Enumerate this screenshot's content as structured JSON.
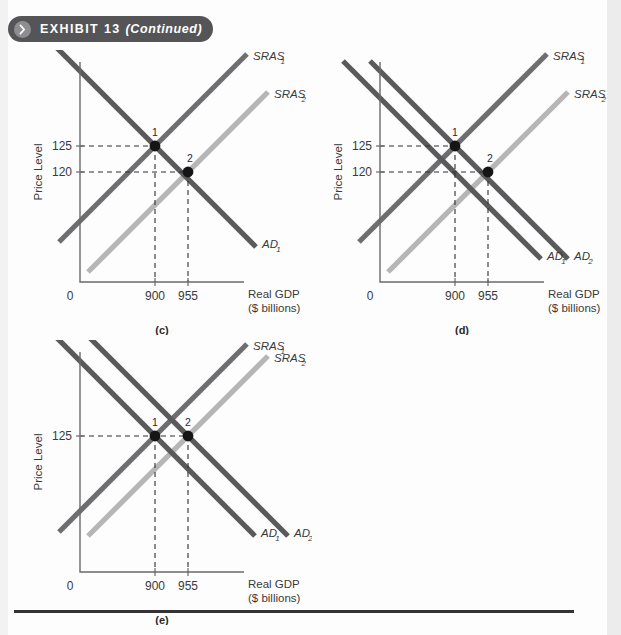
{
  "header": {
    "exhibit_label": "EXHIBIT 13",
    "continued_label": "(Continued)",
    "chevron_icon": "chevron-right-icon",
    "bar_color": "#555558",
    "chevron_color": "#8e8e92"
  },
  "colors": {
    "ad_curve": "#5a5a5c",
    "sras1_curve": "#6e6e70",
    "sras2_curve": "#b6b6b6",
    "axis": "#6a6a6a",
    "dashed": "#2f2f2f",
    "point": "#151515",
    "page_background": "#fdfdfd"
  },
  "common": {
    "ylabel": "Price Level",
    "xlabel_line1": "Real GDP",
    "xlabel_line2": "($ billions)",
    "origin_label": "0"
  },
  "chart_data": [
    {
      "type": "line",
      "panel": "(c)",
      "title": "",
      "xlabel": "Real GDP ($ billions)",
      "ylabel": "Price Level",
      "xticks": [
        "900",
        "955"
      ],
      "xtick_values": [
        900,
        955
      ],
      "yticks": [
        "125",
        "120"
      ],
      "ytick_values": [
        125,
        120
      ],
      "origin_label": "0",
      "grid": false,
      "series": [
        {
          "name": "AD",
          "label": "AD",
          "subscript": "1",
          "slope": "downward",
          "color": "#5a5a5c"
        },
        {
          "name": "SRAS1",
          "label": "SRAS",
          "subscript": "1",
          "slope": "upward",
          "color": "#6e6e70"
        },
        {
          "name": "SRAS2",
          "label": "SRAS",
          "subscript": "2",
          "slope": "upward",
          "color": "#b6b6b6"
        }
      ],
      "points": [
        {
          "label": "1",
          "x": 900,
          "y": 125,
          "on": "AD1 x SRAS1"
        },
        {
          "label": "2",
          "x": 955,
          "y": 120,
          "on": "AD1 x SRAS2"
        }
      ],
      "note": "SRAS shifts right; price level falls from 125 to 120, Real GDP rises from 900 to 955"
    },
    {
      "type": "line",
      "panel": "(d)",
      "title": "",
      "xlabel": "Real GDP ($ billions)",
      "ylabel": "Price Level",
      "xticks": [
        "900",
        "955"
      ],
      "xtick_values": [
        900,
        955
      ],
      "yticks": [
        "125",
        "120"
      ],
      "ytick_values": [
        125,
        120
      ],
      "origin_label": "0",
      "grid": false,
      "series": [
        {
          "name": "AD2",
          "label": "AD",
          "subscript": "2",
          "slope": "downward",
          "color": "#5a5a5c"
        },
        {
          "name": "AD1",
          "label": "AD",
          "subscript": "1",
          "slope": "downward",
          "color": "#5a5a5c"
        },
        {
          "name": "SRAS1",
          "label": "SRAS",
          "subscript": "1",
          "slope": "upward",
          "color": "#6e6e70"
        },
        {
          "name": "SRAS2",
          "label": "SRAS",
          "subscript": "2",
          "slope": "upward",
          "color": "#b6b6b6"
        }
      ],
      "points": [
        {
          "label": "1",
          "x": 900,
          "y": 125,
          "on": "AD2 x SRAS1"
        },
        {
          "label": "2",
          "x": 955,
          "y": 120,
          "on": "AD1 x SRAS2"
        }
      ],
      "note": "Both AD and SRAS shift; price level falls from 125 to 120, Real GDP rises from 900 to 955"
    },
    {
      "type": "line",
      "panel": "(e)",
      "title": "",
      "xlabel": "Real GDP ($ billions)",
      "ylabel": "Price Level",
      "xticks": [
        "900",
        "955"
      ],
      "xtick_values": [
        900,
        955
      ],
      "yticks": [
        "125"
      ],
      "ytick_values": [
        125
      ],
      "origin_label": "0",
      "grid": false,
      "series": [
        {
          "name": "AD2",
          "label": "AD",
          "subscript": "2",
          "slope": "downward",
          "color": "#5a5a5c"
        },
        {
          "name": "AD1",
          "label": "AD",
          "subscript": "1",
          "slope": "downward",
          "color": "#5a5a5c"
        },
        {
          "name": "SRAS1",
          "label": "SRAS",
          "subscript": "1",
          "slope": "upward",
          "color": "#6e6e70"
        },
        {
          "name": "SRAS2",
          "label": "SRAS",
          "subscript": "2",
          "slope": "upward",
          "color": "#b6b6b6"
        }
      ],
      "points": [
        {
          "label": "1",
          "x": 900,
          "y": 125,
          "on": "AD1 x SRAS1"
        },
        {
          "label": "2",
          "x": 955,
          "y": 125,
          "on": "AD2 x SRAS2"
        }
      ],
      "note": "Price level stays at 125; Real GDP rises from 900 to 955"
    }
  ]
}
